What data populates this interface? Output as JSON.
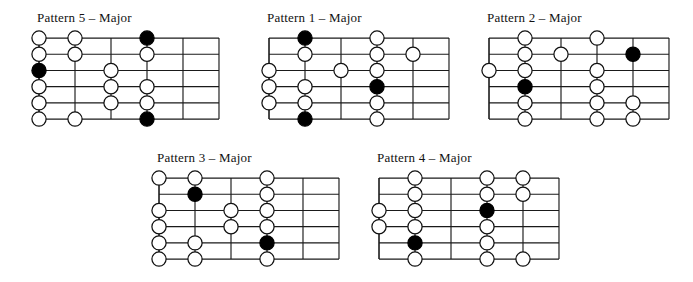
{
  "figure": {
    "title_suffix": "Major",
    "note_colors": {
      "open": "#ffffff",
      "root": "#000000",
      "line": "#1a1a1a"
    },
    "grid": {
      "strings": 6,
      "frets": 5
    }
  },
  "diagrams": [
    {
      "id": "pattern-5",
      "title": "Pattern 5 – Major",
      "x": 33,
      "y": 10,
      "notes": [
        {
          "string": 1,
          "fret": 0,
          "type": "open"
        },
        {
          "string": 1,
          "fret": 1,
          "type": "open"
        },
        {
          "string": 1,
          "fret": 3,
          "type": "root"
        },
        {
          "string": 2,
          "fret": 0,
          "type": "open"
        },
        {
          "string": 2,
          "fret": 1,
          "type": "open"
        },
        {
          "string": 2,
          "fret": 3,
          "type": "open"
        },
        {
          "string": 3,
          "fret": 0,
          "type": "root"
        },
        {
          "string": 3,
          "fret": 2,
          "type": "open"
        },
        {
          "string": 4,
          "fret": 0,
          "type": "open"
        },
        {
          "string": 4,
          "fret": 2,
          "type": "open"
        },
        {
          "string": 4,
          "fret": 3,
          "type": "open"
        },
        {
          "string": 5,
          "fret": 0,
          "type": "open"
        },
        {
          "string": 5,
          "fret": 2,
          "type": "open"
        },
        {
          "string": 5,
          "fret": 3,
          "type": "open"
        },
        {
          "string": 6,
          "fret": 0,
          "type": "open"
        },
        {
          "string": 6,
          "fret": 1,
          "type": "open"
        },
        {
          "string": 6,
          "fret": 3,
          "type": "root"
        }
      ]
    },
    {
      "id": "pattern-1",
      "title": "Pattern 1 – Major",
      "x": 263,
      "y": 10,
      "notes": [
        {
          "string": 1,
          "fret": 1,
          "type": "root"
        },
        {
          "string": 1,
          "fret": 3,
          "type": "open"
        },
        {
          "string": 2,
          "fret": 1,
          "type": "open"
        },
        {
          "string": 2,
          "fret": 3,
          "type": "open"
        },
        {
          "string": 2,
          "fret": 4,
          "type": "open"
        },
        {
          "string": 3,
          "fret": 0,
          "type": "open"
        },
        {
          "string": 3,
          "fret": 2,
          "type": "open"
        },
        {
          "string": 3,
          "fret": 3,
          "type": "open"
        },
        {
          "string": 4,
          "fret": 0,
          "type": "open"
        },
        {
          "string": 4,
          "fret": 1,
          "type": "open"
        },
        {
          "string": 4,
          "fret": 3,
          "type": "root"
        },
        {
          "string": 5,
          "fret": 0,
          "type": "open"
        },
        {
          "string": 5,
          "fret": 1,
          "type": "open"
        },
        {
          "string": 5,
          "fret": 3,
          "type": "open"
        },
        {
          "string": 6,
          "fret": 1,
          "type": "root"
        },
        {
          "string": 6,
          "fret": 3,
          "type": "open"
        }
      ]
    },
    {
      "id": "pattern-2",
      "title": "Pattern 2 – Major",
      "x": 483,
      "y": 10,
      "notes": [
        {
          "string": 1,
          "fret": 1,
          "type": "open"
        },
        {
          "string": 1,
          "fret": 3,
          "type": "open"
        },
        {
          "string": 2,
          "fret": 1,
          "type": "open"
        },
        {
          "string": 2,
          "fret": 2,
          "type": "open"
        },
        {
          "string": 2,
          "fret": 4,
          "type": "root"
        },
        {
          "string": 3,
          "fret": 0,
          "type": "open"
        },
        {
          "string": 3,
          "fret": 1,
          "type": "open"
        },
        {
          "string": 3,
          "fret": 3,
          "type": "open"
        },
        {
          "string": 4,
          "fret": 1,
          "type": "root"
        },
        {
          "string": 4,
          "fret": 3,
          "type": "open"
        },
        {
          "string": 5,
          "fret": 1,
          "type": "open"
        },
        {
          "string": 5,
          "fret": 3,
          "type": "open"
        },
        {
          "string": 5,
          "fret": 4,
          "type": "open"
        },
        {
          "string": 6,
          "fret": 1,
          "type": "open"
        },
        {
          "string": 6,
          "fret": 3,
          "type": "open"
        },
        {
          "string": 6,
          "fret": 4,
          "type": "open"
        }
      ]
    },
    {
      "id": "pattern-3",
      "title": "Pattern 3 – Major",
      "x": 153,
      "y": 150,
      "notes": [
        {
          "string": 1,
          "fret": 0,
          "type": "open"
        },
        {
          "string": 1,
          "fret": 1,
          "type": "open"
        },
        {
          "string": 1,
          "fret": 3,
          "type": "open"
        },
        {
          "string": 2,
          "fret": 1,
          "type": "root"
        },
        {
          "string": 2,
          "fret": 3,
          "type": "open"
        },
        {
          "string": 3,
          "fret": 0,
          "type": "open"
        },
        {
          "string": 3,
          "fret": 2,
          "type": "open"
        },
        {
          "string": 3,
          "fret": 3,
          "type": "open"
        },
        {
          "string": 4,
          "fret": 0,
          "type": "open"
        },
        {
          "string": 4,
          "fret": 2,
          "type": "open"
        },
        {
          "string": 4,
          "fret": 3,
          "type": "open"
        },
        {
          "string": 5,
          "fret": 0,
          "type": "open"
        },
        {
          "string": 5,
          "fret": 1,
          "type": "open"
        },
        {
          "string": 5,
          "fret": 3,
          "type": "root"
        },
        {
          "string": 6,
          "fret": 0,
          "type": "open"
        },
        {
          "string": 6,
          "fret": 1,
          "type": "open"
        },
        {
          "string": 6,
          "fret": 3,
          "type": "open"
        }
      ]
    },
    {
      "id": "pattern-4",
      "title": "Pattern 4 – Major",
      "x": 373,
      "y": 150,
      "notes": [
        {
          "string": 1,
          "fret": 1,
          "type": "open"
        },
        {
          "string": 1,
          "fret": 3,
          "type": "open"
        },
        {
          "string": 1,
          "fret": 4,
          "type": "open"
        },
        {
          "string": 2,
          "fret": 1,
          "type": "open"
        },
        {
          "string": 2,
          "fret": 3,
          "type": "open"
        },
        {
          "string": 2,
          "fret": 4,
          "type": "open"
        },
        {
          "string": 3,
          "fret": 0,
          "type": "open"
        },
        {
          "string": 3,
          "fret": 1,
          "type": "open"
        },
        {
          "string": 3,
          "fret": 3,
          "type": "root"
        },
        {
          "string": 4,
          "fret": 0,
          "type": "open"
        },
        {
          "string": 4,
          "fret": 1,
          "type": "open"
        },
        {
          "string": 4,
          "fret": 3,
          "type": "open"
        },
        {
          "string": 5,
          "fret": 1,
          "type": "root"
        },
        {
          "string": 5,
          "fret": 3,
          "type": "open"
        },
        {
          "string": 6,
          "fret": 1,
          "type": "open"
        },
        {
          "string": 6,
          "fret": 3,
          "type": "open"
        },
        {
          "string": 6,
          "fret": 4,
          "type": "open"
        }
      ]
    }
  ]
}
